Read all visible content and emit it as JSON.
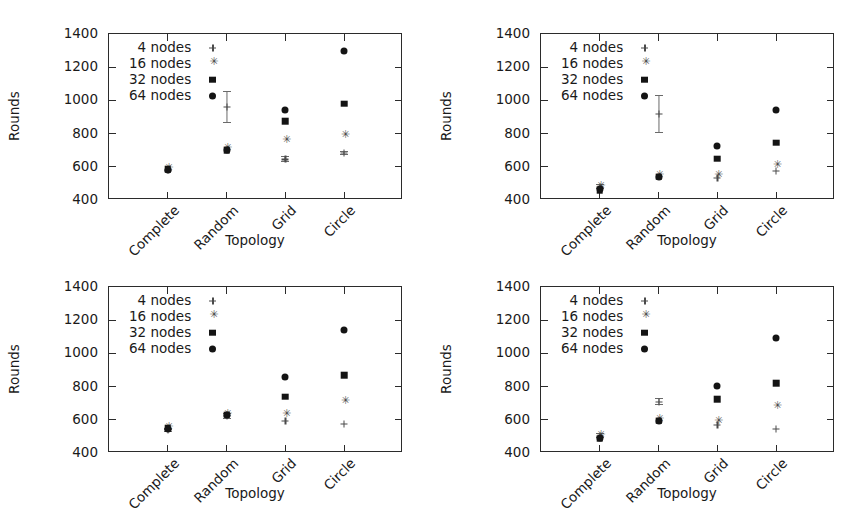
{
  "figure": {
    "panel_count": 4,
    "shared_xlabel": "Topology",
    "shared_ylabel": "Rounds",
    "categories": [
      "Complete",
      "Random",
      "Grid",
      "Circle"
    ],
    "ytick_labels": [
      "400",
      "600",
      "800",
      "1000",
      "1200",
      "1400"
    ],
    "legend_labels": [
      "4 nodes",
      "16 nodes",
      "32 nodes",
      "64 nodes"
    ],
    "legend_markers": [
      "plus-marker",
      "star-marker",
      "square-marker",
      "circle-marker"
    ],
    "marker_color": "#141414",
    "errorbar_color": "#6a6a6a",
    "axis_color": "#2b2b2b",
    "background": "#ffffff"
  },
  "chart_data": [
    {
      "type": "scatter",
      "panel": "top-left",
      "title": "",
      "xlabel": "Topology",
      "ylabel": "Rounds",
      "categories": [
        "Complete",
        "Random",
        "Grid",
        "Circle"
      ],
      "ylim": [
        400,
        1400
      ],
      "ytick_labels": [
        "400",
        "600",
        "800",
        "1000",
        "1200",
        "1400"
      ],
      "grid": false,
      "legend": "upper-left",
      "series": [
        {
          "name": "4 nodes",
          "marker": "plus-marker",
          "values": [
            578,
            960,
            645,
            685
          ],
          "errors": [
            0,
            95,
            18,
            12
          ]
        },
        {
          "name": "16 nodes",
          "marker": "star-marker",
          "values": [
            580,
            700,
            750,
            780
          ],
          "errors": [
            0,
            0,
            0,
            0
          ]
        },
        {
          "name": "32 nodes",
          "marker": "square-marker",
          "values": [
            585,
            700,
            875,
            980
          ],
          "errors": [
            0,
            0,
            0,
            0
          ]
        },
        {
          "name": "64 nodes",
          "marker": "circle-marker",
          "values": [
            583,
            700,
            940,
            1295
          ],
          "errors": [
            0,
            0,
            0,
            0
          ]
        }
      ]
    },
    {
      "type": "scatter",
      "panel": "top-right",
      "title": "",
      "xlabel": "Topology",
      "ylabel": "Rounds",
      "categories": [
        "Complete",
        "Random",
        "Grid",
        "Circle"
      ],
      "ylim": [
        400,
        1400
      ],
      "ytick_labels": [
        "400",
        "600",
        "800",
        "1000",
        "1200",
        "1400"
      ],
      "grid": false,
      "legend": "upper-left",
      "series": [
        {
          "name": "4 nodes",
          "marker": "plus-marker",
          "values": [
            480,
            920,
            535,
            575
          ],
          "errors": [
            14,
            115,
            0,
            0
          ]
        },
        {
          "name": "16 nodes",
          "marker": "star-marker",
          "values": [
            472,
            540,
            540,
            600
          ],
          "errors": [
            0,
            0,
            0,
            0
          ]
        },
        {
          "name": "32 nodes",
          "marker": "square-marker",
          "values": [
            460,
            540,
            650,
            745
          ],
          "errors": [
            0,
            0,
            0,
            0
          ]
        },
        {
          "name": "64 nodes",
          "marker": "circle-marker",
          "values": [
            465,
            540,
            725,
            940
          ],
          "errors": [
            0,
            0,
            0,
            0
          ]
        }
      ]
    },
    {
      "type": "scatter",
      "panel": "bottom-left",
      "title": "",
      "xlabel": "Topology",
      "ylabel": "Rounds",
      "categories": [
        "Complete",
        "Random",
        "Grid",
        "Circle"
      ],
      "ylim": [
        400,
        1400
      ],
      "ytick_labels": [
        "400",
        "600",
        "800",
        "1000",
        "1200",
        "1400"
      ],
      "grid": false,
      "legend": "upper-left",
      "series": [
        {
          "name": "4 nodes",
          "marker": "plus-marker",
          "values": [
            538,
            625,
            595,
            575
          ],
          "errors": [
            10,
            18,
            0,
            0
          ]
        },
        {
          "name": "16 nodes",
          "marker": "star-marker",
          "values": [
            545,
            625,
            620,
            700
          ],
          "errors": [
            0,
            0,
            0,
            0
          ]
        },
        {
          "name": "32 nodes",
          "marker": "square-marker",
          "values": [
            548,
            630,
            740,
            870
          ],
          "errors": [
            0,
            0,
            0,
            0
          ]
        },
        {
          "name": "64 nodes",
          "marker": "circle-marker",
          "values": [
            543,
            628,
            855,
            1140
          ],
          "errors": [
            0,
            0,
            0,
            0
          ]
        }
      ]
    },
    {
      "type": "scatter",
      "panel": "bottom-right",
      "title": "",
      "xlabel": "Topology",
      "ylabel": "Rounds",
      "categories": [
        "Complete",
        "Random",
        "Grid",
        "Circle"
      ],
      "ylim": [
        400,
        1400
      ],
      "ytick_labels": [
        "400",
        "600",
        "800",
        "1000",
        "1200",
        "1400"
      ],
      "grid": false,
      "legend": "upper-left",
      "series": [
        {
          "name": "4 nodes",
          "marker": "plus-marker",
          "values": [
            505,
            710,
            570,
            545
          ],
          "errors": [
            16,
            22,
            0,
            0
          ]
        },
        {
          "name": "16 nodes",
          "marker": "star-marker",
          "values": [
            495,
            595,
            580,
            670
          ],
          "errors": [
            0,
            0,
            0,
            0
          ]
        },
        {
          "name": "32 nodes",
          "marker": "square-marker",
          "values": [
            485,
            595,
            725,
            820
          ],
          "errors": [
            0,
            0,
            0,
            0
          ]
        },
        {
          "name": "64 nodes",
          "marker": "circle-marker",
          "values": [
            488,
            592,
            805,
            1090
          ],
          "errors": [
            0,
            0,
            0,
            0
          ]
        }
      ]
    }
  ]
}
